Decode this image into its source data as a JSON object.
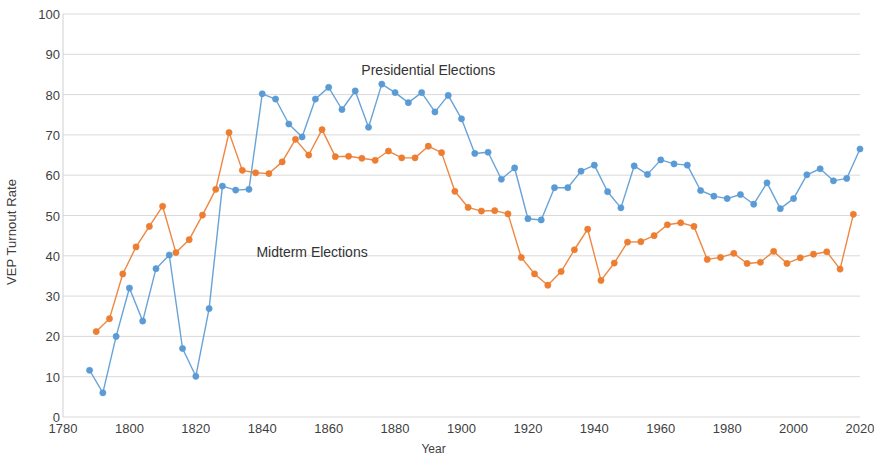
{
  "chart_data": {
    "type": "line",
    "title": "",
    "xlabel": "Year",
    "ylabel": "VEP Turnout Rate",
    "xlim": [
      1780,
      2020
    ],
    "ylim": [
      0,
      100
    ],
    "grid": true,
    "grid_axis": "y",
    "legend_position": "inline-annotation",
    "xticks": [
      1780,
      1800,
      1820,
      1840,
      1860,
      1880,
      1900,
      1920,
      1940,
      1960,
      1980,
      2000,
      2020
    ],
    "yticks": [
      0,
      10,
      20,
      30,
      40,
      50,
      60,
      70,
      80,
      90,
      100
    ],
    "annotations": [
      {
        "text": "Presidential Elections",
        "x": 1890,
        "y": 86
      },
      {
        "text": "Midterm Elections",
        "x": 1855,
        "y": 41
      }
    ],
    "series": [
      {
        "name": "Presidential Elections",
        "color": "#5B9BD5",
        "marker": "circle",
        "x": [
          1788,
          1792,
          1796,
          1800,
          1804,
          1808,
          1812,
          1816,
          1820,
          1824,
          1828,
          1832,
          1836,
          1840,
          1844,
          1848,
          1852,
          1856,
          1860,
          1864,
          1868,
          1872,
          1876,
          1880,
          1884,
          1888,
          1892,
          1896,
          1900,
          1904,
          1908,
          1912,
          1916,
          1920,
          1924,
          1928,
          1932,
          1936,
          1940,
          1944,
          1948,
          1952,
          1956,
          1960,
          1964,
          1968,
          1972,
          1976,
          1980,
          1984,
          1988,
          1992,
          1996,
          2000,
          2004,
          2008,
          2012,
          2016,
          2020
        ],
        "y": [
          11.6,
          6.0,
          20.0,
          32.0,
          23.8,
          36.8,
          40.2,
          17.0,
          10.1,
          26.9,
          57.3,
          56.3,
          56.5,
          80.2,
          78.9,
          72.7,
          69.5,
          78.9,
          81.8,
          76.3,
          80.9,
          71.9,
          82.6,
          80.5,
          78.0,
          80.5,
          75.7,
          79.8,
          74.0,
          65.4,
          65.7,
          59.0,
          61.8,
          49.2,
          48.9,
          56.9,
          56.9,
          61.0,
          62.5,
          55.9,
          51.9,
          62.3,
          60.2,
          63.8,
          62.8,
          62.5,
          56.2,
          54.8,
          54.2,
          55.2,
          52.8,
          58.1,
          51.7,
          54.2,
          60.1,
          61.6,
          58.6,
          59.2,
          66.5
        ]
      },
      {
        "name": "Midterm Elections",
        "color": "#ED7D31",
        "marker": "circle",
        "x": [
          1790,
          1794,
          1798,
          1802,
          1806,
          1810,
          1814,
          1818,
          1822,
          1826,
          1830,
          1834,
          1838,
          1842,
          1846,
          1850,
          1854,
          1858,
          1862,
          1866,
          1870,
          1874,
          1878,
          1882,
          1886,
          1890,
          1894,
          1898,
          1902,
          1906,
          1910,
          1914,
          1918,
          1922,
          1926,
          1930,
          1934,
          1938,
          1942,
          1946,
          1950,
          1954,
          1958,
          1962,
          1966,
          1970,
          1974,
          1978,
          1982,
          1986,
          1990,
          1994,
          1998,
          2002,
          2006,
          2010,
          2014,
          2018
        ],
        "y": [
          21.2,
          24.4,
          35.5,
          42.2,
          47.3,
          52.3,
          40.8,
          44.0,
          50.1,
          56.5,
          70.6,
          61.2,
          60.6,
          60.4,
          63.3,
          68.9,
          65.0,
          71.3,
          64.6,
          64.7,
          64.2,
          63.7,
          66.0,
          64.3,
          64.3,
          67.2,
          65.6,
          56.0,
          52.0,
          51.1,
          51.2,
          50.4,
          39.6,
          35.5,
          32.7,
          36.1,
          41.5,
          46.6,
          33.9,
          38.2,
          43.4,
          43.5,
          45.0,
          47.7,
          48.2,
          47.3,
          39.1,
          39.6,
          40.6,
          38.1,
          38.4,
          41.1,
          38.1,
          39.5,
          40.4,
          41.0,
          36.7,
          50.3
        ]
      }
    ]
  },
  "axes": {
    "y_title": "VEP Turnout Rate",
    "x_title": "Year"
  }
}
